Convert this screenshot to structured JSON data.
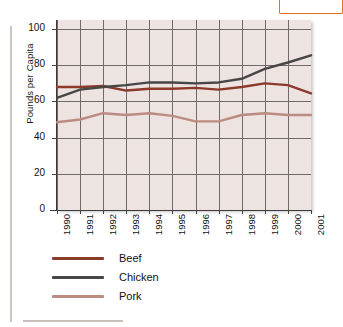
{
  "chart_data": {
    "type": "line",
    "title": "",
    "xlabel": "",
    "ylabel": "Pounds per Capita",
    "categories": [
      "1990",
      "1991",
      "1992",
      "1993",
      "1994",
      "1995",
      "1996",
      "1997",
      "1998",
      "1999",
      "2000",
      "2001"
    ],
    "ylim": [
      0,
      105
    ],
    "yticks": [
      0,
      20,
      40,
      60,
      80,
      100
    ],
    "ytick_labels": [
      "0",
      "20",
      "40",
      "60",
      "80",
      "100"
    ],
    "grid": true,
    "legend_position": "bottom-left",
    "series": [
      {
        "name": "Beef",
        "color": "#8C3A2C",
        "values": [
          68,
          68,
          68.5,
          66,
          67,
          67,
          67.5,
          66.5,
          68,
          70,
          69,
          64.5
        ]
      },
      {
        "name": "Chicken",
        "color": "#474747",
        "values": [
          62,
          66.5,
          68,
          69,
          70.5,
          70.5,
          70,
          70.5,
          72.5,
          78,
          81.5,
          85.5
        ]
      },
      {
        "name": "Pork",
        "color": "#BD8C80",
        "values": [
          48.5,
          50,
          53.5,
          52.5,
          53.5,
          52,
          49,
          49,
          52.5,
          53.5,
          52.5,
          52.5
        ]
      }
    ]
  },
  "legend": {
    "items": [
      {
        "label": "Beef",
        "color": "#8C3A2C"
      },
      {
        "label": "Chicken",
        "color": "#474747"
      },
      {
        "label": "Pork",
        "color": "#BD8C80"
      }
    ]
  },
  "colors": {
    "plot_background": "#EDE3E1",
    "gridline": "#6F6A68",
    "axis": "#3A3A3A",
    "accent_box_border": "#E2721F",
    "rule": "#CFC3BD"
  }
}
